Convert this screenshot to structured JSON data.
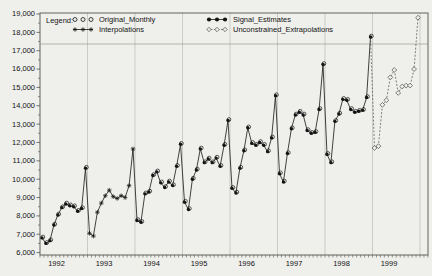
{
  "window": {
    "background": "#efefec"
  },
  "legend": {
    "title": "Legend:",
    "entries": [
      {
        "label": "Original_Monthly",
        "marker": "open-circle",
        "line": "none"
      },
      {
        "label": "Interpolations",
        "marker": "star",
        "line": "solid"
      },
      {
        "label": "Signal_Estimates",
        "marker": "filled-circle",
        "line": "solid"
      },
      {
        "label": "Unconstrained_Extrapolations",
        "marker": "open-diamond",
        "line": "dashed"
      }
    ]
  },
  "chart_data": {
    "type": "line",
    "title": "",
    "xlabel": "",
    "ylabel": "",
    "ylim": [
      6000,
      19000
    ],
    "ytick_step": 1000,
    "y_tick_labels": [
      "6,000",
      "7,000",
      "8,000",
      "9,000",
      "10,000",
      "11,000",
      "12,000",
      "13,000",
      "14,000",
      "15,000",
      "16,000",
      "17,000",
      "18,000",
      "19,000"
    ],
    "years": [
      "1992",
      "1993",
      "1994",
      "1995",
      "1996",
      "1997",
      "1998",
      "1999"
    ],
    "grid": "vertical-year-lines",
    "legend_position": "top-inside-framed",
    "colors": {
      "line": "#141414",
      "extrapolation_line": "#4a4a46",
      "gridline": "#bcbcb8",
      "frame": "#55554f"
    },
    "series": [
      {
        "name": "Original_Monthly",
        "marker": "open-circle",
        "line": "solid",
        "values_by_year": {
          "1992": [
            6800,
            6500,
            6650,
            7500,
            8050,
            8450,
            8650,
            8550,
            8500,
            8250,
            8400,
            10600
          ],
          "1994": [
            7750,
            7650,
            9200,
            9300,
            10200,
            10400,
            9800,
            9550,
            9850,
            9650,
            10700,
            11900
          ],
          "1995": [
            8750,
            8350,
            10000,
            10500,
            11650,
            10900,
            11100,
            10900,
            11150,
            10700,
            11850,
            13200
          ],
          "1996": [
            9500,
            9250,
            10600,
            11550,
            12800,
            11950,
            11850,
            12000,
            11850,
            11500,
            12250,
            14550
          ],
          "1997": [
            10300,
            9850,
            11400,
            12750,
            13500,
            13650,
            13500,
            12650,
            12500,
            12550,
            13800,
            16250
          ],
          "1998": [
            11350,
            10900,
            13150,
            13550,
            14350,
            14300,
            13800,
            13650,
            13700,
            13750,
            14450,
            17750
          ]
        }
      },
      {
        "name": "Interpolations",
        "marker": "star",
        "line": "solid",
        "values_by_year": {
          "1993": [
            7050,
            6900,
            8200,
            8700,
            9100,
            9400,
            9050,
            8950,
            9100,
            9000,
            9650,
            11650
          ]
        }
      },
      {
        "name": "Signal_Estimates",
        "marker": "filled-circle",
        "line": "solid",
        "values_by_year": {
          "1992": [
            6800,
            6500,
            6650,
            7500,
            8050,
            8450,
            8650,
            8550,
            8500,
            8250,
            8400,
            10600
          ],
          "1994": [
            7750,
            7650,
            9200,
            9300,
            10200,
            10400,
            9800,
            9550,
            9850,
            9650,
            10700,
            11900
          ],
          "1995": [
            8750,
            8350,
            10000,
            10500,
            11650,
            10900,
            11100,
            10900,
            11150,
            10700,
            11850,
            13200
          ],
          "1996": [
            9500,
            9250,
            10600,
            11550,
            12800,
            11950,
            11850,
            12000,
            11850,
            11500,
            12250,
            14550
          ],
          "1997": [
            10300,
            9850,
            11400,
            12750,
            13500,
            13650,
            13500,
            12650,
            12500,
            12550,
            13800,
            16250
          ],
          "1998": [
            11350,
            10900,
            13150,
            13550,
            14350,
            14300,
            13800,
            13650,
            13700,
            13750,
            14450,
            17750
          ]
        }
      },
      {
        "name": "Unconstrained_Extrapolations",
        "marker": "open-diamond",
        "line": "dashed",
        "values_by_year": {
          "1999": [
            11700,
            11800,
            14050,
            14300,
            15550,
            15950,
            14700,
            15050,
            15100,
            15100,
            16000,
            18800
          ]
        }
      }
    ]
  }
}
